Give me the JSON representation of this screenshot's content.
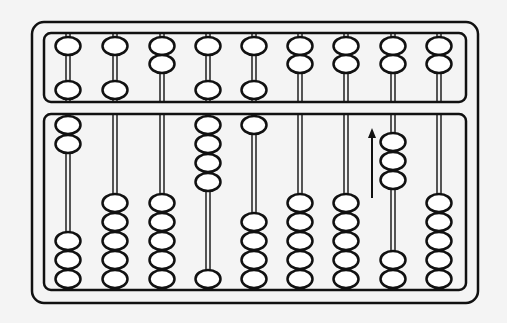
{
  "figure": {
    "colors": {
      "background": "#f4f4f4",
      "ink": "#111111",
      "bead_fill": "#ffffff"
    },
    "frame": {
      "outer": {
        "x": 32,
        "y": 22,
        "w": 446,
        "h": 281,
        "r": 12
      },
      "upper_deck": {
        "x": 44,
        "y": 33,
        "w": 422,
        "h": 69,
        "r": 7
      },
      "lower_deck": {
        "x": 44,
        "y": 114,
        "w": 422,
        "h": 176,
        "r": 7
      }
    },
    "bead": {
      "w": 25,
      "h": 18,
      "pitch": 19
    },
    "rods": [
      {
        "x": 68,
        "upper_top": 1,
        "upper_bottom": 1,
        "lower_top": 2,
        "lower_bottom": 3
      },
      {
        "x": 115,
        "upper_top": 1,
        "upper_bottom": 1,
        "lower_top": 0,
        "lower_bottom": 5
      },
      {
        "x": 162,
        "upper_top": 2,
        "upper_bottom": 0,
        "lower_top": 0,
        "lower_bottom": 5
      },
      {
        "x": 208,
        "upper_top": 1,
        "upper_bottom": 1,
        "lower_top": 4,
        "lower_bottom": 1
      },
      {
        "x": 254,
        "upper_top": 1,
        "upper_bottom": 1,
        "lower_top": 1,
        "lower_bottom": 4
      },
      {
        "x": 300,
        "upper_top": 2,
        "upper_bottom": 0,
        "lower_top": 0,
        "lower_bottom": 5
      },
      {
        "x": 346,
        "upper_top": 2,
        "upper_bottom": 0,
        "lower_top": 0,
        "lower_bottom": 5
      },
      {
        "x": 393,
        "upper_top": 2,
        "upper_bottom": 0,
        "lower_top": 0,
        "lower_bottom": 2,
        "lower_mid": {
          "count": 3,
          "start_y": 133
        }
      },
      {
        "x": 439,
        "upper_top": 2,
        "upper_bottom": 0,
        "lower_top": 0,
        "lower_bottom": 5
      }
    ],
    "arrow": {
      "x": 372,
      "y_tail": 198,
      "y_head": 128,
      "direction": "up",
      "label": "move-beads-up"
    }
  }
}
